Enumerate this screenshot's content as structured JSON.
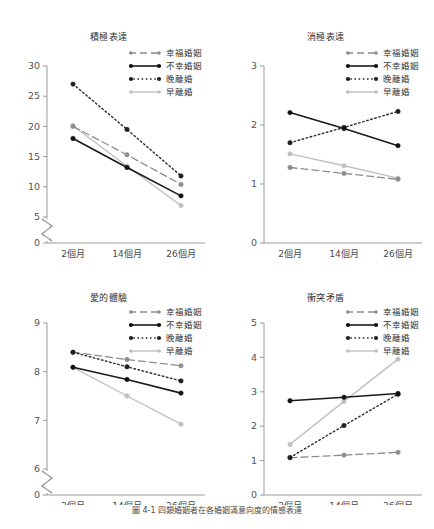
{
  "figure": {
    "caption_prefix": "圖 ",
    "caption_number": "4-1",
    "caption_text": "四類婚姻者在各婚姻滿意向度的情感表達"
  },
  "series_styles": {
    "happy": {
      "color": "#8c8c8c",
      "dash": "7,4",
      "width": 1.3,
      "marker": "#8c8c8c"
    },
    "unhappy": {
      "color": "#1a1a1a",
      "dash": "none",
      "width": 1.6,
      "marker": "#111111"
    },
    "late_divorce": {
      "color": "#2b2b2b",
      "dash": "1.6,2.6",
      "width": 1.4,
      "marker": "#1f1f1f"
    },
    "early_divorce": {
      "color": "#c0c0c0",
      "dash": "none",
      "width": 1.4,
      "marker": "#bfbfbf"
    }
  },
  "legend": {
    "items": [
      {
        "key": "happy",
        "label": "幸福婚姻"
      },
      {
        "key": "unhappy",
        "label": "不幸婚姻"
      },
      {
        "key": "late_divorce",
        "label": "晚離婚"
      },
      {
        "key": "early_divorce",
        "label": "早離婚"
      }
    ]
  },
  "chart_data": [
    {
      "id": "positive-expression",
      "type": "line",
      "title": "積極表達",
      "xlabel": "",
      "ylabel": "",
      "categories": [
        "2個月",
        "14個月",
        "26個月"
      ],
      "yticks": [
        0,
        5,
        10,
        15,
        20,
        25,
        30
      ],
      "ylim": [
        0,
        30
      ],
      "axis_break": true,
      "break_between": [
        0,
        5
      ],
      "grid": false,
      "legend_position": "top-right",
      "series": [
        {
          "name": "幸福婚姻",
          "key": "happy",
          "values": [
            20.0,
            15.3,
            10.4
          ]
        },
        {
          "name": "不幸婚姻",
          "key": "unhappy",
          "values": [
            18.0,
            13.2,
            8.5
          ]
        },
        {
          "name": "晚離婚",
          "key": "late_divorce",
          "values": [
            27.0,
            19.5,
            11.8
          ]
        },
        {
          "name": "早離婚",
          "key": "early_divorce",
          "values": [
            20.1,
            13.4,
            6.9
          ]
        }
      ]
    },
    {
      "id": "negative-expression",
      "type": "line",
      "title": "消極表達",
      "xlabel": "",
      "ylabel": "",
      "categories": [
        "2個月",
        "14個月",
        "26個月"
      ],
      "yticks": [
        0,
        1,
        2,
        3
      ],
      "ylim": [
        0,
        3
      ],
      "axis_break": false,
      "break_between": [],
      "grid": false,
      "legend_position": "top-right",
      "series": [
        {
          "name": "幸福婚姻",
          "key": "happy",
          "values": [
            1.28,
            1.18,
            1.08
          ]
        },
        {
          "name": "不幸婚姻",
          "key": "unhappy",
          "values": [
            2.21,
            1.94,
            1.65
          ]
        },
        {
          "name": "晚離婚",
          "key": "late_divorce",
          "values": [
            1.7,
            1.96,
            2.23
          ]
        },
        {
          "name": "早離婚",
          "key": "early_divorce",
          "values": [
            1.51,
            1.31,
            1.1
          ]
        }
      ]
    },
    {
      "id": "experience-of-love",
      "type": "line",
      "title": "愛的體驗",
      "xlabel": "",
      "ylabel": "",
      "categories": [
        "2個月",
        "14個月",
        "26個月"
      ],
      "yticks": [
        0,
        6,
        7,
        8,
        9
      ],
      "ylim": [
        0,
        9
      ],
      "axis_break": true,
      "break_between": [
        0,
        6
      ],
      "grid": false,
      "legend_position": "top-right",
      "series": [
        {
          "name": "幸福婚姻",
          "key": "happy",
          "values": [
            8.4,
            8.25,
            8.12
          ]
        },
        {
          "name": "不幸婚姻",
          "key": "unhappy",
          "values": [
            8.09,
            7.84,
            7.56
          ]
        },
        {
          "name": "晚離婚",
          "key": "late_divorce",
          "values": [
            8.4,
            8.1,
            7.81
          ]
        },
        {
          "name": "早離婚",
          "key": "early_divorce",
          "values": [
            8.09,
            7.5,
            6.92
          ]
        }
      ]
    },
    {
      "id": "conflict",
      "type": "line",
      "title": "衝突矛盾",
      "xlabel": "",
      "ylabel": "",
      "categories": [
        "2個月",
        "14個月",
        "26個月"
      ],
      "yticks": [
        0,
        1,
        2,
        3,
        4,
        5
      ],
      "ylim": [
        0,
        5
      ],
      "axis_break": false,
      "break_between": [],
      "grid": false,
      "legend_position": "top-right",
      "series": [
        {
          "name": "幸福婚姻",
          "key": "happy",
          "values": [
            1.08,
            1.16,
            1.24
          ]
        },
        {
          "name": "不幸婚姻",
          "key": "unhappy",
          "values": [
            2.74,
            2.84,
            2.95
          ]
        },
        {
          "name": "晚離婚",
          "key": "late_divorce",
          "values": [
            1.09,
            2.02,
            2.93
          ]
        },
        {
          "name": "早離婚",
          "key": "early_divorce",
          "values": [
            1.47,
            2.72,
            3.95
          ]
        }
      ]
    }
  ]
}
